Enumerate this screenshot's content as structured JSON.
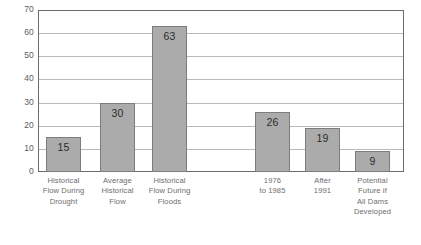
{
  "chart_data": {
    "type": "bar",
    "title": "",
    "subtitle": "",
    "xlabel": "",
    "ylabel": "",
    "ylim": [
      0,
      70
    ],
    "grid": true,
    "legend": "none",
    "orientation": "vertical",
    "y_ticks": [
      0,
      10,
      20,
      30,
      40,
      50,
      60,
      70
    ],
    "y_tick_labels": [
      "0",
      "10",
      "20",
      "30",
      "40",
      "50",
      "60",
      "70"
    ],
    "categories": [
      "Historical Flow During Drought",
      "Average Historical Flow",
      "Historical Flow During Floods",
      "1976 to 1985",
      "After 1991",
      "Potential Future if All Dams Developed"
    ],
    "category_lines": [
      [
        "Historical",
        "Flow During",
        "Drought"
      ],
      [
        "Average",
        "Historical",
        "Flow"
      ],
      [
        "Historical",
        "Flow During",
        "Floods"
      ],
      [
        "1976",
        "to 1985"
      ],
      [
        "After",
        "1991"
      ],
      [
        "Potential",
        "Future if",
        "All Dams",
        "Developed"
      ]
    ],
    "values": [
      15,
      30,
      63,
      26,
      19,
      9
    ],
    "value_labels": [
      "15",
      "30",
      "63",
      "26",
      "19",
      "9"
    ],
    "colors": {
      "bar_fill": "#ababab",
      "bar_border": "#7d7d7d",
      "gridline": "#b9b9b9",
      "frame": "#6b6b6b",
      "tick_text": "#5b5b5b",
      "category_text": "#6d6d6d",
      "value_text": "#2b2b2b",
      "background": "#ffffff"
    }
  }
}
